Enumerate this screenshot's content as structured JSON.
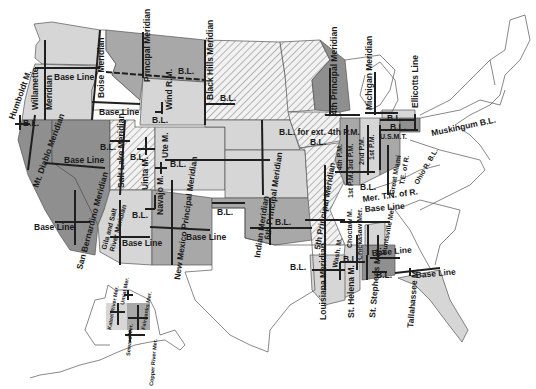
{
  "map": {
    "subject": "Principal Meridians and Base Lines of the United States",
    "colors": {
      "background": "#ffffff",
      "light_fill": "#d6d6d6",
      "medium_fill": "#a8a8a8",
      "dark_fill": "#8f8f8f",
      "hatched_fill": "#e8e8e8",
      "line": "#1f1f1f",
      "state_border": "#555555"
    },
    "legend_patterns": [
      "light gray",
      "medium gray",
      "dark gray",
      "diagonal hatching",
      "white (no survey)"
    ]
  },
  "labels": {
    "humboldt": "Humboldt M.",
    "willamette": "Willamette",
    "willamette_meridian": "Meridian",
    "base_line_or": "Base Line",
    "boise_meridian": "Boise Meridian",
    "base_line_id": "Base Line",
    "principal_meridian": "Principal Meridian",
    "bl_montana": "B.L.",
    "wind_rm": "Wind R.M.",
    "bl_wind": "B.L.",
    "black_hills_meridian": "Black Hills Meridian",
    "bl_black_hills": "B.L.",
    "fourth_principal_meridian": "4th Principal Meridian",
    "michigan_meridian": "Michigan Meridian",
    "ellicotts_line": "Ellicotts Line",
    "bl_michigan_1": "B.L.",
    "bl_michigan_2": "B.L.",
    "usmt": "U.S.M.T.",
    "muskingum_bl": "Muskingum B.L.",
    "bl_humboldt": "B.L.",
    "mt_diablo_meridian": "Mt. Diablo Meridian",
    "base_line_ca": "Base Line",
    "san_bernardino_meridian": "San Bernardino Meridian",
    "base_line_socal": "Base Line",
    "salt_lake_meridian": "Salt Lake Meridian",
    "bl_salt_lake": "B.L.",
    "bl_uinta": "B.L.",
    "uinta_m": "Uinta M.",
    "ute_m": "Ute M.",
    "bl_ute": "B.L.",
    "gila_salt_1": "Gila and Salt",
    "gila_salt_2": "River Meridian",
    "bl_gila": "B.L.",
    "base_line_az": "Base Line",
    "navajo_m": "Navajo M.",
    "new_mexico_principal_meridian": "New Mexico Principal Meridian",
    "base_line_nm": "Base Line",
    "bl_texas_panhandle": "B.L.",
    "sixth_principal_meridian": "6th Principal Meridian",
    "indian_meridian": "Indian Meridian",
    "bl_indian": "B.L.",
    "bl_for_ext": "B.L. for ext. 4th P.M.",
    "bl_illinois": "B.L.",
    "fourth_pm": "4th P.M.",
    "third_pm": "3rd P.M.",
    "second_pm": "2nd P.M.",
    "first_pm": "1st P.M.",
    "fifth_principal_meridian": "5th Principal Meridian",
    "first_pm_lower": "1st P.M.",
    "bl_central": "B.L.",
    "great_miami_mer": "Great Miami",
    "te_of_r": "T.E. of R.",
    "ohio_r_bl": "Ohio R. B.L.",
    "mer_tn_of_r": "Mer. T.N. of R.",
    "base_line_tn": "Base Line",
    "chickasaw_mer": "Chickasaw Mer.",
    "choctaw_m": "Choctaw M.",
    "huntsville_mer": "Huntsville Mer.",
    "base_line_al": "Base Line",
    "bl_arkansas": "B.L.",
    "wash_m": "Wash. M.",
    "bl_wash": "B.L.",
    "louisiana_meridian": "Louisiana Meridian",
    "st_helena_m": "St. Helena M.",
    "st_stephens_mer": "St. Stephens Mer.",
    "bl_st_stephens": "B.L.",
    "tallahassee_m": "Tallahassee M.",
    "base_line_fl": "Base Line",
    "kateel_river_mer": "Kateel River Mer.",
    "umiat_mer": "Umiat Mer.",
    "fairbanks_mer": "Fairbanks Mer.",
    "seward_mer": "Seward Mer.",
    "copper_river_mer": "Copper River Mer."
  }
}
